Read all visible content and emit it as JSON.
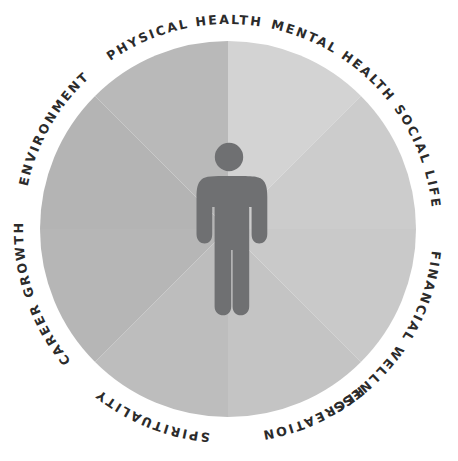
{
  "diagram": {
    "type": "radial-segmented-circle",
    "center_icon": "person-figure-icon",
    "background_color": "#ffffff",
    "figure_color": "#6f7072",
    "label_color": "#2b2b2b",
    "circle": {
      "center_x": 228,
      "center_y": 229,
      "radius": 188
    },
    "segments": [
      {
        "id": "mental-health",
        "label": "MENTAL HEALTH",
        "color": "#d3d3d3",
        "start_angle": -90,
        "end_angle": -45,
        "label_start_angle": -78,
        "label_sweep": 1
      },
      {
        "id": "social-life",
        "label": "SOCIAL LIFE",
        "color": "#cccccc",
        "start_angle": -45,
        "end_angle": 0,
        "label_start_angle": -36,
        "label_sweep": 1
      },
      {
        "id": "financial-wellness",
        "label": "FINANCIAL WELLNESS",
        "color": "#c9c9c9",
        "start_angle": 0,
        "end_angle": 45,
        "label_start_angle": 6,
        "label_sweep": 1
      },
      {
        "id": "recreation",
        "label": "RECREATION",
        "color": "#c4c4c4",
        "start_angle": 45,
        "end_angle": 90,
        "label_start_angle": 50,
        "label_sweep": 1
      },
      {
        "id": "spirituality",
        "label": "SPIRITUALITY",
        "color": "#bdbdbd",
        "start_angle": 90,
        "end_angle": 135,
        "label_start_angle": 95,
        "label_sweep": 1
      },
      {
        "id": "career-growth",
        "label": "CAREER GROWTH",
        "color": "#b6b6b6",
        "start_angle": 135,
        "end_angle": 180,
        "label_start_angle": 140,
        "label_sweep": 1
      },
      {
        "id": "environment",
        "label": "ENVIRONMENT",
        "color": "#b4b4b4",
        "start_angle": 180,
        "end_angle": 225,
        "label_start_angle": -168,
        "label_sweep": 1
      },
      {
        "id": "physical-health",
        "label": "PHYSICAL HEALTH",
        "color": "#b9b9b9",
        "start_angle": 225,
        "end_angle": 270,
        "label_start_angle": -125,
        "label_sweep": 1
      }
    ]
  }
}
